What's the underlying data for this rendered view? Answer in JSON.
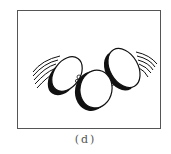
{
  "figure": {
    "caption": "(d)",
    "colors": {
      "frame": "#555555",
      "ink": "#111111",
      "background": "#ffffff"
    }
  }
}
